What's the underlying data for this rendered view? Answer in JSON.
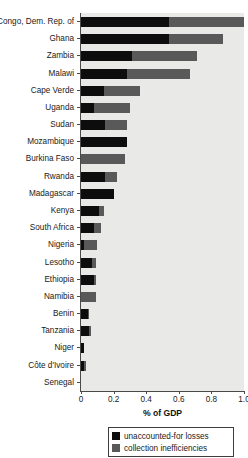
{
  "chart_data": {
    "type": "bar",
    "orientation": "horizontal",
    "stacked": true,
    "title": "",
    "xlabel": "% of GDP",
    "ylabel": "",
    "xlim": [
      0,
      1.0
    ],
    "xticks": [
      0,
      0.2,
      0.4,
      0.6,
      0.8,
      1.0
    ],
    "xtick_labels": [
      "0",
      "0.2",
      "0.4",
      "0.6",
      "0.8",
      "1.0"
    ],
    "grid": false,
    "legend_position": "bottom-center",
    "categories": [
      "Congo, Dem. Rep. of",
      "Ghana",
      "Zambia",
      "Malawi",
      "Cape Verde",
      "Uganda",
      "Sudan",
      "Mozambique",
      "Burkina Faso",
      "Rwanda",
      "Madagascar",
      "Kenya",
      "South Africa",
      "Nigeria",
      "Lesotho",
      "Ethiopia",
      "Namibia",
      "Benin",
      "Tanzania",
      "Niger",
      "Côte d'Ivoire",
      "Senegal"
    ],
    "series": [
      {
        "name": "unaccounted-for losses",
        "color": "#0d0d0d",
        "values": [
          0.54,
          0.54,
          0.31,
          0.28,
          0.14,
          0.08,
          0.15,
          0.28,
          0.0,
          0.15,
          0.2,
          0.11,
          0.08,
          0.02,
          0.07,
          0.08,
          0.0,
          0.04,
          0.05,
          0.02,
          0.02,
          0.0
        ]
      },
      {
        "name": "collection inefficiencies",
        "color": "#595959",
        "values": [
          0.46,
          0.33,
          0.4,
          0.39,
          0.22,
          0.22,
          0.13,
          0.0,
          0.27,
          0.07,
          0.0,
          0.03,
          0.04,
          0.08,
          0.02,
          0.01,
          0.09,
          0.01,
          0.01,
          0.0,
          0.01,
          0.0
        ]
      }
    ],
    "totals": [
      1.0,
      0.87,
      0.71,
      0.67,
      0.36,
      0.3,
      0.28,
      0.28,
      0.27,
      0.22,
      0.2,
      0.14,
      0.12,
      0.1,
      0.09,
      0.09,
      0.09,
      0.05,
      0.06,
      0.02,
      0.03,
      0.0
    ]
  },
  "axis": {
    "xlabel": "% of GDP",
    "tick_labels": [
      "0",
      "0.2",
      "0.4",
      "0.6",
      "0.8",
      "1.0"
    ]
  },
  "legend": {
    "items": [
      {
        "label": "unaccounted-for losses",
        "color": "#0d0d0d"
      },
      {
        "label": "collection inefficiencies",
        "color": "#595959"
      }
    ]
  },
  "colors": {
    "plot_background": "#e9e9e7",
    "axis": "#4a4a4a",
    "series_1": "#0d0d0d",
    "series_2": "#595959",
    "page_background": "#ffffff"
  }
}
